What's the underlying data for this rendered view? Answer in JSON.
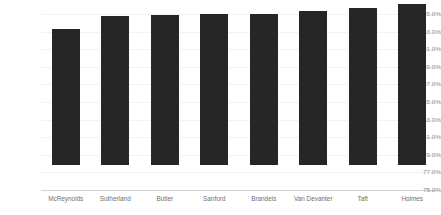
{
  "chart_data": {
    "type": "bar",
    "title": "",
    "subtitle": "",
    "xlabel": "",
    "ylabel": "",
    "categories": [
      "McReynolds",
      "Sutherland",
      "Butler",
      "Sanford",
      "Brandeis",
      "Van Devanter",
      "Taft",
      "Holmes"
    ],
    "values": [
      90.5,
      91.9,
      92.0,
      92.2,
      92.2,
      92.5,
      92.8,
      93.3
    ],
    "value_format": "percent",
    "ylim": [
      75.0,
      95.0
    ],
    "ytick_step": 2.0,
    "ytick_labels": [
      "95.0%",
      "93.0%",
      "91.0%",
      "89.0%",
      "87.0%",
      "85.0%",
      "83.0%",
      "81.0%",
      "79.0%",
      "77.0%",
      "75.0%"
    ],
    "ytick_values": [
      95.0,
      93.0,
      91.0,
      89.0,
      87.0,
      85.0,
      83.0,
      81.0,
      79.0,
      77.0,
      75.0
    ],
    "grid": true,
    "grid_axis": "y",
    "legend": false,
    "legend_position": "none",
    "series": [
      {
        "name": "",
        "values": [
          90.5,
          91.9,
          92.0,
          92.2,
          92.2,
          92.5,
          92.8,
          93.3
        ]
      }
    ],
    "colors": {
      "bar": "#262626",
      "gridline": "#f2f2f2",
      "axis_line": "#d0d0d0",
      "tick_label": "#8a8a8a",
      "category_label": "#6f6f6f",
      "background": "#ffffff"
    }
  }
}
